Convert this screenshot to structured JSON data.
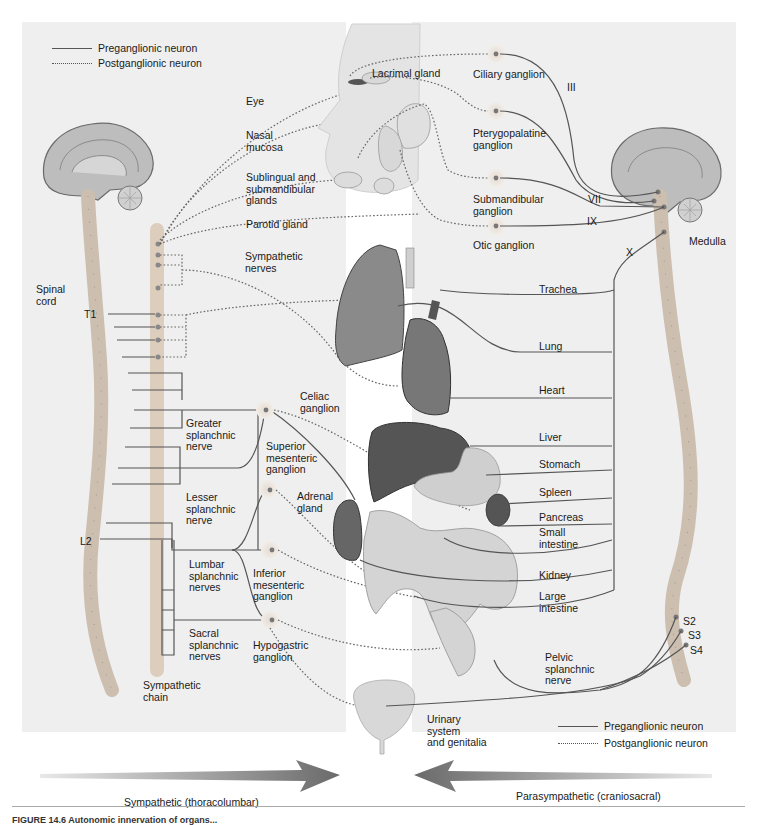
{
  "figure": {
    "legend_top_left": {
      "preganglionic": "Preganglionic neuron",
      "postganglionic": "Postganglionic neuron"
    },
    "legend_bottom_right": {
      "preganglionic": "Preganglionic neuron",
      "postganglionic": "Postganglionic neuron"
    },
    "sympathetic_labels": {
      "spinal_cord": "Spinal\ncord",
      "t1": "T1",
      "l2": "L2",
      "sympathetic_nerves": "Sympathetic\nnerves",
      "celiac_ganglion": "Celiac\nganglion",
      "greater_splanchnic": "Greater\nsplanchnic\nnerve",
      "superior_mesenteric": "Superior\nmesenteric\nganglion",
      "lesser_splanchnic": "Lesser\nsplanchnic\nnerve",
      "adrenal_gland": "Adrenal\ngland",
      "lumbar_splanchnic": "Lumbar\nsplanchnic\nnerves",
      "inferior_mesenteric": "Inferior\nmesenteric\nganglion",
      "sacral_splanchnic": "Sacral\nsplanchnic\nnerves",
      "hypogastric_ganglion": "Hypogastric\nganglion",
      "sympathetic_chain": "Sympathetic\nchain"
    },
    "target_labels": {
      "eye": "Eye",
      "lacrimal_gland": "Lacrimal gland",
      "nasal_mucosa": "Nasal\nmucosa",
      "sublingual": "Sublingual and\nsubmandibular\nglands",
      "parotid": "Parotid gland",
      "urinary": "Urinary\nsystem\nand genitalia"
    },
    "parasympathetic_labels": {
      "ciliary_ganglion": "Ciliary ganglion",
      "pterygopalatine_ganglion": "Pterygopalatine\nganglion",
      "submandibular_ganglion": "Submandibular\nganglion",
      "otic_ganglion": "Otic ganglion",
      "cn_iii": "III",
      "cn_vii": "VII",
      "cn_ix": "IX",
      "cn_x": "X",
      "medulla": "Medulla",
      "pelvic_splanchnic": "Pelvic\nsplanchnic\nnerve",
      "s2": "S2",
      "s3": "S3",
      "s4": "S4"
    },
    "organs": [
      "Trachea",
      "Lung",
      "Heart",
      "Liver",
      "Stomach",
      "Spleen",
      "Pancreas",
      "Small\nintestine",
      "Kidney",
      "Large\nintestine"
    ],
    "arrows": {
      "sympathetic": "Sympathetic (thoracolumbar)",
      "parasympathetic": "Parasympathetic (craniosacral)"
    },
    "caption": "FIGURE 14.6 Autonomic innervation of organs..."
  },
  "colors": {
    "panel": "#efefef",
    "nerve": "#555555",
    "ganglion": "#d8d0c8",
    "organ_dark": "#4a4a4a",
    "organ_light": "#c8c8c8",
    "arrow": "#6e6e6e"
  }
}
